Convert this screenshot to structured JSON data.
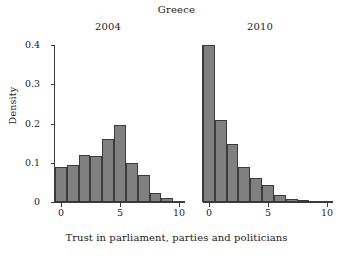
{
  "chart_data": {
    "type": "bar",
    "title": "Greece",
    "xlabel": "Trust in parliament, parties and politicians",
    "ylabel": "Density",
    "grid": false,
    "legend": "none",
    "xlim": [
      -0.5,
      10.5
    ],
    "ylim": [
      0,
      0.4
    ],
    "yticks": [
      0,
      0.1,
      0.2,
      0.3,
      0.4
    ],
    "ytick_labels": [
      "0",
      "0.1",
      "0.2",
      "0.3",
      "0.4"
    ],
    "xticks": [
      0,
      5,
      10
    ],
    "xtick_labels": [
      "0",
      "5",
      "10"
    ],
    "panels": [
      {
        "label": "2004",
        "categories": [
          0,
          1,
          2,
          3,
          4,
          5,
          6,
          7,
          8,
          9,
          10
        ],
        "values": [
          0.088,
          0.094,
          0.121,
          0.118,
          0.16,
          0.195,
          0.1,
          0.069,
          0.024,
          0.01,
          0.003
        ]
      },
      {
        "label": "2010",
        "categories": [
          0,
          1,
          2,
          3,
          4,
          5,
          6,
          7,
          8,
          9,
          10
        ],
        "values": [
          0.4,
          0.21,
          0.147,
          0.088,
          0.06,
          0.044,
          0.017,
          0.008,
          0.004,
          0.002,
          0.001
        ]
      }
    ],
    "colors": {
      "bar_fill": "#808080",
      "bar_edge": "#3b3b3b",
      "axis": "#3a3a3a",
      "text": "#1a1a1a",
      "background": "#ffffff"
    }
  }
}
